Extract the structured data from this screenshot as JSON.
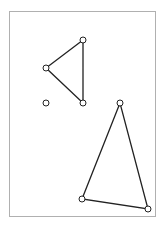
{
  "canvas": {
    "width": 165,
    "height": 229,
    "background": "#ffffff"
  },
  "frame": {
    "x": 9,
    "y": 11,
    "width": 146,
    "height": 205,
    "stroke": "#b0b0b0"
  },
  "colors": {
    "line": "#222222",
    "vertex_fill": "#ffffff"
  },
  "shapes": {
    "triangle_upper": {
      "points": [
        [
          83,
          40
        ],
        [
          46,
          68
        ],
        [
          83,
          103
        ]
      ]
    },
    "triangle_lower": {
      "points": [
        [
          120,
          103
        ],
        [
          82,
          199
        ],
        [
          148,
          209
        ]
      ]
    },
    "lone_point": {
      "x": 46,
      "y": 103
    }
  },
  "vertex_radius": 3
}
